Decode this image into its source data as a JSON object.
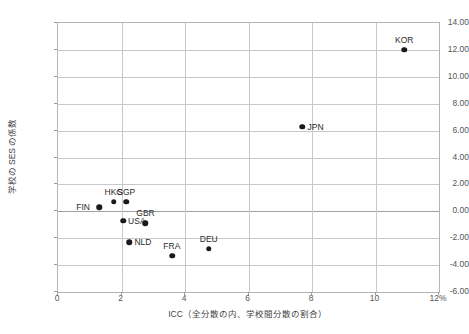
{
  "chart_data": {
    "type": "scatter",
    "title": "",
    "xlabel": "ICC（全分散の内、学校間分散の割合）",
    "ylabel": "学校の SES の係数",
    "xlim": [
      0,
      12
    ],
    "ylim": [
      -6.0,
      14.0
    ],
    "xticks": [
      "0",
      "2",
      "4",
      "6",
      "8",
      "10",
      "12%"
    ],
    "xtick_values": [
      0,
      2,
      4,
      6,
      8,
      10,
      12
    ],
    "yticks": [
      "14.00",
      "12.00",
      "10.00",
      "8.00",
      "6.00",
      "4.00",
      "2.00",
      "0.00",
      "-2.00",
      "-4.00",
      "-6.00"
    ],
    "ytick_values": [
      14,
      12,
      10,
      8,
      6,
      4,
      2,
      0,
      -2,
      -4,
      -6
    ],
    "grid": true,
    "legend": false,
    "marker_color": "#1a1a1a",
    "grid_color": "#c8c8c8",
    "points": [
      {
        "label": "FIN",
        "x": 1.3,
        "y": 0.3,
        "label_pos": "left"
      },
      {
        "label": "HKG",
        "x": 1.75,
        "y": 0.7,
        "label_pos": "above"
      },
      {
        "label": "SGP",
        "x": 2.15,
        "y": 0.7,
        "label_pos": "above"
      },
      {
        "label": "USA",
        "x": 2.05,
        "y": -0.7,
        "label_pos": "right"
      },
      {
        "label": "GBR",
        "x": 2.75,
        "y": -0.9,
        "label_pos": "above"
      },
      {
        "label": "NLD",
        "x": 2.25,
        "y": -2.3,
        "label_pos": "right"
      },
      {
        "label": "FRA",
        "x": 3.6,
        "y": -3.3,
        "label_pos": "above"
      },
      {
        "label": "DEU",
        "x": 4.75,
        "y": -2.8,
        "label_pos": "above"
      },
      {
        "label": "JPN",
        "x": 7.7,
        "y": 6.3,
        "label_pos": "right"
      },
      {
        "label": "KOR",
        "x": 10.9,
        "y": 12.0,
        "label_pos": "above"
      }
    ]
  }
}
